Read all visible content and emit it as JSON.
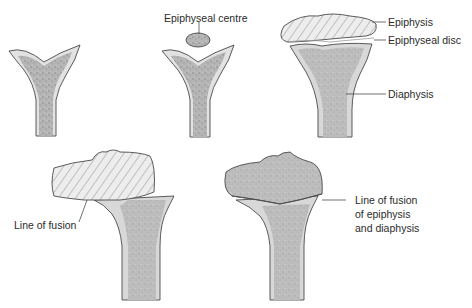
{
  "diagram": {
    "colors": {
      "bone_fill": "#b9b9b9",
      "bone_light": "#d6d6d6",
      "outline": "#4a4a4a",
      "hatch": "#6e6e6e",
      "text": "#2b2b2b"
    },
    "stages": [
      {
        "id": 1,
        "description": "Cartilaginous end without ossification centre",
        "labels": []
      },
      {
        "id": 2,
        "description": "Appearance of epiphyseal centre",
        "labels": [
          "Epiphyseal centre"
        ]
      },
      {
        "id": 3,
        "description": "Epiphysis separated by epiphyseal disc",
        "labels": [
          "Epiphysis",
          "Epiphyseal disc",
          "Diaphysis"
        ]
      },
      {
        "id": 4,
        "description": "Fusion beginning",
        "labels": [
          "Line of fusion"
        ]
      },
      {
        "id": 5,
        "description": "Complete fusion",
        "labels": [
          "Line of fusion of epiphysis and diaphysis"
        ]
      }
    ],
    "labels": {
      "epiphyseal_centre": "Epiphyseal centre",
      "epiphysis": "Epiphysis",
      "epiphyseal_disc": "Epiphyseal disc",
      "diaphysis": "Diaphysis",
      "line_of_fusion": "Line of fusion",
      "line_of_fusion_full_1": "Line of fusion",
      "line_of_fusion_full_2": "of epiphysis",
      "line_of_fusion_full_3": "and diaphysis"
    }
  }
}
